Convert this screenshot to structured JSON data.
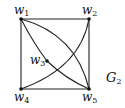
{
  "graph": {
    "name": "G",
    "name_subscript": "2",
    "vertices": [
      {
        "id": "w1",
        "label": "w",
        "sub": "1",
        "x": 21,
        "y": 19
      },
      {
        "id": "w2",
        "label": "w",
        "sub": "2",
        "x": 89,
        "y": 19
      },
      {
        "id": "w3",
        "label": "w",
        "sub": "3",
        "x": 47,
        "y": 61
      },
      {
        "id": "w4",
        "label": "w",
        "sub": "4",
        "x": 21,
        "y": 89
      },
      {
        "id": "w5",
        "label": "w",
        "sub": "5",
        "x": 89,
        "y": 89
      }
    ],
    "edges": [
      [
        "w1",
        "w2"
      ],
      [
        "w2",
        "w5"
      ],
      [
        "w5",
        "w4"
      ],
      [
        "w4",
        "w1"
      ],
      [
        "w1",
        "w5"
      ],
      [
        "w1",
        "w3"
      ],
      [
        "w3",
        "w5"
      ],
      [
        "w4",
        "w2"
      ]
    ],
    "colors": {
      "line": "#222222",
      "text": "#111111",
      "background": "#ffffff"
    }
  }
}
